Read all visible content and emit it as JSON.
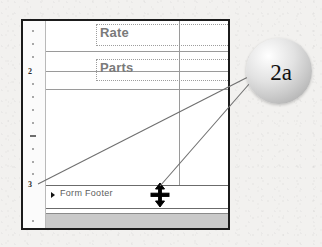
{
  "callout": {
    "label": "2a",
    "shape": "sphere"
  },
  "designer": {
    "ruler": {
      "orientation": "vertical",
      "unit_labels": [
        "2",
        "3"
      ],
      "tick_count": 14
    },
    "controls": [
      {
        "name": "rate-textbox",
        "label": "Rate"
      },
      {
        "name": "parts-textbox",
        "label": "Parts"
      }
    ],
    "sections": [
      {
        "name": "form-footer",
        "label": "Form Footer",
        "marker": "section-expander-icon"
      }
    ],
    "cursor": {
      "name": "vertical-resize-cursor",
      "glyph": "resize-vertical"
    }
  },
  "colors": {
    "page_background": "#f2f1ef",
    "surface": "#ffffff",
    "frame_border": "#1b1b1b",
    "gridline": "#9a9a9a",
    "control_text": "#7a7a7a",
    "section_label": "#5d5d5d",
    "footer_body": "#c9c9c9",
    "leader_line": "#6f6f6f"
  }
}
